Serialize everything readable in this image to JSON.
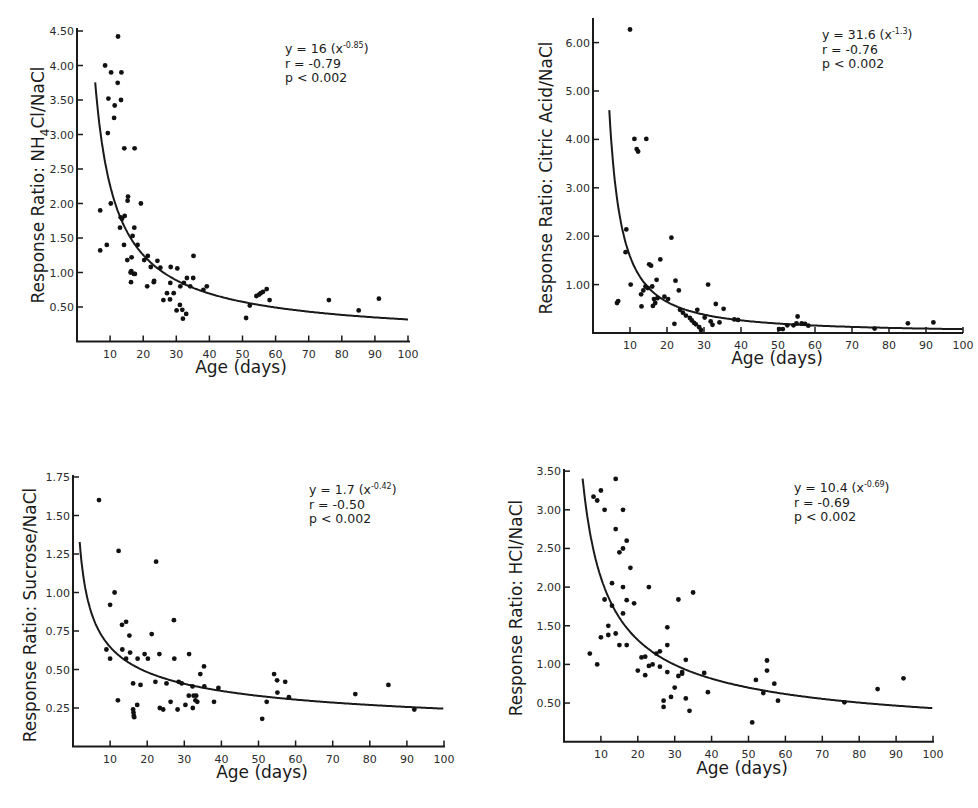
{
  "chart_data": [
    {
      "id": "nh4cl",
      "type": "scatter",
      "title": "",
      "xlabel": "Age (days)",
      "ylabel": "Response Ratio: NH4Cl/NaCl",
      "ylabel_parts": {
        "pre": "Response Ratio: NH",
        "sub": "4",
        "post": "Cl/NaCl"
      },
      "xlim": [
        0,
        100
      ],
      "ylim": [
        0,
        4.5
      ],
      "x_ticks": [
        10,
        20,
        30,
        40,
        50,
        60,
        70,
        80,
        90,
        100
      ],
      "x_tick_labels": [
        "10",
        "20",
        "30",
        "40",
        "50",
        "60",
        "70",
        "80",
        "90",
        "100"
      ],
      "y_ticks": [
        0.5,
        1.0,
        1.5,
        2.0,
        2.5,
        3.0,
        3.5,
        4.0,
        4.5
      ],
      "y_tick_labels": [
        "0.50",
        "1.00",
        "1.50",
        "2.00",
        "2.50",
        "3.00",
        "3.50",
        "4.00",
        "4.50"
      ],
      "grid": false,
      "fit": {
        "a": 16,
        "b": -0.85,
        "x_start": 5.5
      },
      "annotation": {
        "eq_pre": "y = 16 (x",
        "eq_exp": "-0.85",
        "eq_post": ")",
        "r": "r = -0.79",
        "p": "p < 0.002"
      },
      "points": [
        [
          7,
          1.32
        ],
        [
          7,
          1.9
        ],
        [
          8.5,
          4.0
        ],
        [
          9,
          1.4
        ],
        [
          9.3,
          3.02
        ],
        [
          9.5,
          3.52
        ],
        [
          10.2,
          2.0
        ],
        [
          10.3,
          3.9
        ],
        [
          11.2,
          3.24
        ],
        [
          11.4,
          3.42
        ],
        [
          12.3,
          3.75
        ],
        [
          12.4,
          4.42
        ],
        [
          13,
          1.65
        ],
        [
          13.2,
          1.8
        ],
        [
          13.3,
          3.5
        ],
        [
          13.4,
          3.9
        ],
        [
          13.6,
          1.78
        ],
        [
          14.2,
          1.4
        ],
        [
          14.3,
          2.8
        ],
        [
          14.4,
          1.82
        ],
        [
          15.2,
          1.18
        ],
        [
          15.3,
          2.04
        ],
        [
          15.4,
          2.1
        ],
        [
          16.2,
          1.0
        ],
        [
          16.3,
          0.86
        ],
        [
          16.4,
          1.02
        ],
        [
          16.5,
          1.22
        ],
        [
          16.8,
          1.53
        ],
        [
          17.2,
          0.98
        ],
        [
          17.3,
          1.65
        ],
        [
          17.4,
          2.8
        ],
        [
          17.5,
          0.98
        ],
        [
          18.3,
          1.4
        ],
        [
          19.3,
          2.0
        ],
        [
          20.3,
          1.18
        ],
        [
          21.2,
          0.8
        ],
        [
          21.4,
          1.24
        ],
        [
          22.3,
          1.08
        ],
        [
          23.2,
          0.86
        ],
        [
          23.3,
          0.88
        ],
        [
          24.3,
          1.17
        ],
        [
          25.2,
          1.07
        ],
        [
          26.1,
          0.6
        ],
        [
          27.2,
          0.7
        ],
        [
          28.1,
          0.61
        ],
        [
          28.2,
          0.85
        ],
        [
          28.3,
          1.08
        ],
        [
          29.2,
          0.7
        ],
        [
          30.1,
          0.45
        ],
        [
          30.3,
          1.06
        ],
        [
          31.1,
          0.53
        ],
        [
          31.2,
          0.8
        ],
        [
          31.8,
          0.46
        ],
        [
          32.0,
          0.33
        ],
        [
          32.3,
          0.85
        ],
        [
          33.0,
          0.4
        ],
        [
          33.2,
          0.92
        ],
        [
          34.2,
          0.8
        ],
        [
          35.1,
          0.92
        ],
        [
          35.2,
          1.24
        ],
        [
          38.2,
          0.75
        ],
        [
          39.2,
          0.8
        ],
        [
          51.1,
          0.34
        ],
        [
          52.2,
          0.52
        ],
        [
          54.2,
          0.66
        ],
        [
          55.0,
          0.68
        ],
        [
          55.5,
          0.7
        ],
        [
          56.2,
          0.72
        ],
        [
          57.3,
          0.76
        ],
        [
          58.2,
          0.6
        ],
        [
          76.1,
          0.6
        ],
        [
          85.1,
          0.45
        ],
        [
          91.2,
          0.62
        ]
      ]
    },
    {
      "id": "citric",
      "type": "scatter",
      "title": "",
      "xlabel": "Age (days)",
      "ylabel": "Response Ratio: Citric Acid/NaCl",
      "ylabel_parts": {
        "pre": "Response Ratio: Citric Acid/NaCl",
        "sub": "",
        "post": ""
      },
      "xlim": [
        0,
        100
      ],
      "ylim": [
        0,
        6.5
      ],
      "x_ticks": [
        10,
        20,
        30,
        40,
        50,
        60,
        70,
        80,
        90,
        100
      ],
      "x_tick_labels": [
        "10",
        "20",
        "30",
        "40",
        "50",
        "60",
        "70",
        "80",
        "90",
        "100"
      ],
      "y_ticks": [
        1.0,
        2.0,
        3.0,
        4.0,
        5.0,
        6.0
      ],
      "y_tick_labels": [
        "1.00",
        "2.00",
        "3.00",
        "4.00",
        "5.00",
        "6.00"
      ],
      "grid": false,
      "fit": {
        "a": 31.6,
        "b": -1.3,
        "x_start": 4.4
      },
      "annotation": {
        "eq_pre": "y = 31.6 (x",
        "eq_exp": "-1.3",
        "eq_post": ")",
        "r": "r = -0.76",
        "p": "p < 0.002"
      },
      "points": [
        [
          6.5,
          0.62
        ],
        [
          6.8,
          0.66
        ],
        [
          8.8,
          1.67
        ],
        [
          9.0,
          2.14
        ],
        [
          10.0,
          6.27
        ],
        [
          10.2,
          1.0
        ],
        [
          11.2,
          4.01
        ],
        [
          11.8,
          3.8
        ],
        [
          12.2,
          3.75
        ],
        [
          13.0,
          0.8
        ],
        [
          13.1,
          0.55
        ],
        [
          13.6,
          0.88
        ],
        [
          14.2,
          0.96
        ],
        [
          14.4,
          4.01
        ],
        [
          14.8,
          0.93
        ],
        [
          15.2,
          1.42
        ],
        [
          15.7,
          1.39
        ],
        [
          16.0,
          0.96
        ],
        [
          16.2,
          0.56
        ],
        [
          16.5,
          0.7
        ],
        [
          16.8,
          0.62
        ],
        [
          17.2,
          1.1
        ],
        [
          17.4,
          0.72
        ],
        [
          18.2,
          1.52
        ],
        [
          19.3,
          0.75
        ],
        [
          20.3,
          0.7
        ],
        [
          21.2,
          1.97
        ],
        [
          22.0,
          0.19
        ],
        [
          22.3,
          1.08
        ],
        [
          23.2,
          0.88
        ],
        [
          23.5,
          0.48
        ],
        [
          24.3,
          0.42
        ],
        [
          25.1,
          0.36
        ],
        [
          26.2,
          0.31
        ],
        [
          26.7,
          0.26
        ],
        [
          27.3,
          0.21
        ],
        [
          27.8,
          0.18
        ],
        [
          28.2,
          0.48
        ],
        [
          28.7,
          0.12
        ],
        [
          29.2,
          0.06
        ],
        [
          30.2,
          0.32
        ],
        [
          31.1,
          1.0
        ],
        [
          31.8,
          0.24
        ],
        [
          32.3,
          0.17
        ],
        [
          33.2,
          0.6
        ],
        [
          34.2,
          0.22
        ],
        [
          35.3,
          0.5
        ],
        [
          38.2,
          0.28
        ],
        [
          39.2,
          0.27
        ],
        [
          50.3,
          0.08
        ],
        [
          51.3,
          0.08
        ],
        [
          52.5,
          0.16
        ],
        [
          54.2,
          0.16
        ],
        [
          55.0,
          0.2
        ],
        [
          55.3,
          0.34
        ],
        [
          56.4,
          0.2
        ],
        [
          57.3,
          0.19
        ],
        [
          58.2,
          0.15
        ],
        [
          76.1,
          0.09
        ],
        [
          85.1,
          0.2
        ],
        [
          92.0,
          0.22
        ]
      ]
    },
    {
      "id": "sucrose",
      "type": "scatter",
      "title": "",
      "xlabel": "Age (days)",
      "ylabel": "Response Ratio: Sucrose/NaCl",
      "ylabel_parts": {
        "pre": "Response Ratio: Sucrose/NaCl",
        "sub": "",
        "post": ""
      },
      "xlim": [
        0,
        100
      ],
      "ylim": [
        0,
        1.75
      ],
      "x_ticks": [
        10,
        20,
        30,
        40,
        50,
        60,
        70,
        80,
        90,
        100
      ],
      "x_tick_labels": [
        "10",
        "20",
        "30",
        "40",
        "50",
        "60",
        "70",
        "80",
        "90",
        "100"
      ],
      "y_ticks": [
        0.25,
        0.5,
        0.75,
        1.0,
        1.25,
        1.5,
        1.75
      ],
      "y_tick_labels": [
        "0.25",
        "0.50",
        "0.75",
        "1.00",
        "1.25",
        "1.50",
        "1.75"
      ],
      "grid": false,
      "fit": {
        "a": 1.7,
        "b": -0.42,
        "x_start": 1.8
      },
      "annotation": {
        "eq_pre": "y = 1.7 (x",
        "eq_exp": "-0.42",
        "eq_post": ")",
        "r": "r = -0.50",
        "p": "p < 0.002"
      },
      "points": [
        [
          7,
          1.6
        ],
        [
          9,
          0.63
        ],
        [
          10,
          0.92
        ],
        [
          10,
          0.57
        ],
        [
          11.2,
          1.0
        ],
        [
          12.1,
          0.3
        ],
        [
          12.3,
          1.27
        ],
        [
          13.2,
          0.79
        ],
        [
          13.3,
          0.63
        ],
        [
          14.3,
          0.81
        ],
        [
          14.3,
          0.57
        ],
        [
          15.2,
          0.72
        ],
        [
          15.4,
          0.61
        ],
        [
          16.2,
          0.41
        ],
        [
          16.2,
          0.24
        ],
        [
          16.3,
          0.22
        ],
        [
          16.4,
          0.2
        ],
        [
          16.5,
          0.19
        ],
        [
          17.3,
          0.27
        ],
        [
          17.4,
          0.57
        ],
        [
          18.2,
          0.4
        ],
        [
          19.3,
          0.6
        ],
        [
          20.2,
          0.57
        ],
        [
          21.2,
          0.73
        ],
        [
          22.2,
          0.42
        ],
        [
          22.4,
          1.2
        ],
        [
          23.3,
          0.6
        ],
        [
          23.4,
          0.25
        ],
        [
          24.3,
          0.24
        ],
        [
          25.2,
          0.41
        ],
        [
          26.3,
          0.29
        ],
        [
          27.2,
          0.82
        ],
        [
          27.3,
          0.57
        ],
        [
          28.2,
          0.24
        ],
        [
          28.5,
          0.42
        ],
        [
          29.3,
          0.41
        ],
        [
          30.3,
          0.27
        ],
        [
          31.3,
          0.6
        ],
        [
          31.2,
          0.33
        ],
        [
          32.2,
          0.39
        ],
        [
          32.3,
          0.25
        ],
        [
          32.5,
          0.33
        ],
        [
          33.0,
          0.3
        ],
        [
          33.2,
          0.33
        ],
        [
          33.5,
          0.29
        ],
        [
          34.3,
          0.47
        ],
        [
          35.3,
          0.52
        ],
        [
          35.4,
          0.39
        ],
        [
          38.0,
          0.29
        ],
        [
          39.2,
          0.38
        ],
        [
          51.0,
          0.18
        ],
        [
          52.2,
          0.29
        ],
        [
          54.2,
          0.47
        ],
        [
          55.0,
          0.43
        ],
        [
          55.1,
          0.35
        ],
        [
          57.2,
          0.42
        ],
        [
          58.2,
          0.32
        ],
        [
          76.1,
          0.34
        ],
        [
          85.0,
          0.4
        ],
        [
          92.0,
          0.24
        ]
      ]
    },
    {
      "id": "hcl",
      "type": "scatter",
      "title": "",
      "xlabel": "Age (days)",
      "ylabel": "Response Ratio: HCl/NaCl",
      "ylabel_parts": {
        "pre": "Response Ratio: HCl/NaCl",
        "sub": "",
        "post": ""
      },
      "xlim": [
        0,
        100
      ],
      "ylim": [
        0,
        3.5
      ],
      "x_ticks": [
        10,
        20,
        30,
        40,
        50,
        60,
        70,
        80,
        90,
        100
      ],
      "x_tick_labels": [
        "10",
        "20",
        "30",
        "40",
        "50",
        "60",
        "70",
        "80",
        "90",
        "100"
      ],
      "y_ticks": [
        0.5,
        1.0,
        1.5,
        2.0,
        2.5,
        3.0,
        3.5
      ],
      "y_tick_labels": [
        "0.50",
        "1.00",
        "1.50",
        "2.00",
        "2.50",
        "3.00",
        "3.50"
      ],
      "grid": false,
      "fit": {
        "a": 10.4,
        "b": -0.69,
        "x_start": 4.3
      },
      "annotation": {
        "eq_pre": "y = 10.4 (x",
        "eq_exp": "-0.69",
        "eq_post": ")",
        "r": "r = -0.69",
        "p": "p < 0.002"
      },
      "points": [
        [
          7,
          1.14
        ],
        [
          8,
          3.17
        ],
        [
          9,
          3.12
        ],
        [
          9,
          1.0
        ],
        [
          10,
          1.35
        ],
        [
          10,
          3.25
        ],
        [
          11,
          3.0
        ],
        [
          11,
          1.84
        ],
        [
          12,
          1.5
        ],
        [
          12,
          1.38
        ],
        [
          13,
          2.05
        ],
        [
          13,
          1.76
        ],
        [
          14,
          3.4
        ],
        [
          14,
          2.75
        ],
        [
          14,
          1.4
        ],
        [
          15,
          2.45
        ],
        [
          15,
          1.25
        ],
        [
          16,
          3.0
        ],
        [
          16,
          2.5
        ],
        [
          16,
          2.0
        ],
        [
          16,
          1.66
        ],
        [
          17,
          2.6
        ],
        [
          17,
          1.83
        ],
        [
          17,
          1.25
        ],
        [
          18,
          2.25
        ],
        [
          19,
          1.79
        ],
        [
          20,
          0.92
        ],
        [
          21,
          1.09
        ],
        [
          22,
          1.1
        ],
        [
          22,
          0.86
        ],
        [
          23,
          2.0
        ],
        [
          23,
          0.98
        ],
        [
          24,
          1.0
        ],
        [
          25,
          1.14
        ],
        [
          26,
          1.17
        ],
        [
          26,
          0.97
        ],
        [
          27,
          0.53
        ],
        [
          27,
          0.45
        ],
        [
          28,
          1.48
        ],
        [
          28,
          1.25
        ],
        [
          28,
          0.9
        ],
        [
          29,
          0.58
        ],
        [
          30,
          0.7
        ],
        [
          31,
          1.84
        ],
        [
          31,
          0.85
        ],
        [
          32,
          0.9
        ],
        [
          32,
          0.88
        ],
        [
          33,
          1.06
        ],
        [
          33,
          0.56
        ],
        [
          34,
          0.4
        ],
        [
          35,
          1.93
        ],
        [
          38,
          0.89
        ],
        [
          39,
          0.64
        ],
        [
          51,
          0.25
        ],
        [
          52,
          0.8
        ],
        [
          54,
          0.63
        ],
        [
          55,
          1.05
        ],
        [
          55,
          0.92
        ],
        [
          57,
          0.75
        ],
        [
          58,
          0.53
        ],
        [
          76,
          0.51
        ],
        [
          85,
          0.68
        ],
        [
          92,
          0.82
        ]
      ]
    }
  ],
  "layout": [
    {
      "x0": 77,
      "x_per": 3.31,
      "y0": 341.5,
      "y_per": 69,
      "top": 28,
      "right": 410,
      "ylabel_x": 44,
      "ylabel_y": 185,
      "xlabel_x": 241,
      "xlabel_y": 373,
      "ann_x": 285,
      "ann_y": 53
    },
    {
      "x0": 593,
      "x_per": 3.7,
      "y0": 333,
      "y_per": 48.4,
      "top": 18,
      "right": 963,
      "ylabel_x": 552,
      "ylabel_y": 178,
      "xlabel_x": 777,
      "xlabel_y": 364,
      "ann_x": 822,
      "ann_y": 39
    },
    {
      "x0": 73,
      "x_per": 3.71,
      "y0": 746.5,
      "y_per": 154,
      "top": 475,
      "right": 445,
      "ylabel_x": 36,
      "ylabel_y": 615,
      "xlabel_x": 262,
      "xlabel_y": 778,
      "ann_x": 309,
      "ann_y": 494
    },
    {
      "x0": 564,
      "x_per": 3.69,
      "y0": 741.7,
      "y_per": 77.3,
      "top": 469,
      "right": 934,
      "ylabel_x": 522,
      "ylabel_y": 608,
      "xlabel_x": 742,
      "xlabel_y": 774,
      "ann_x": 794,
      "ann_y": 492
    }
  ]
}
